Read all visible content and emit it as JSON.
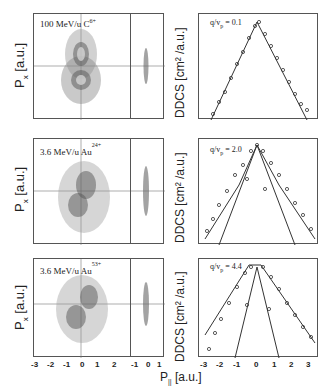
{
  "figure": {
    "x_axis_label": "P",
    "x_axis_sub": "||",
    "x_axis_unit": " [a.u.]",
    "rows": [
      {
        "label": "100 MeV/u C",
        "charge": "6+",
        "ylabel": "P",
        "ysub": "x",
        "yunit": " [a.u.]",
        "ddcs_label": "DDCS [cm² /a.u.]",
        "q_label": "q/v",
        "q_sub": "p",
        "q_value": " = 0.1"
      },
      {
        "label": "3.6 MeV/u  Au",
        "charge": "24+",
        "ylabel": "P",
        "ysub": "x",
        "yunit": " [a.u.]",
        "ddcs_label": "DDCS [cm² /a.u.]",
        "q_label": "q/v",
        "q_sub": "p",
        "q_value": " = 2.0"
      },
      {
        "label": "3.6 MeV/u  Au",
        "charge": "53+",
        "ylabel": "P",
        "ysub": "x",
        "yunit": " [a.u.]",
        "ddcs_label": "DDCS [cm² /a.u.]",
        "q_label": "q/v",
        "q_sub": "p",
        "q_value": " = 4.4"
      }
    ],
    "left_xticks": [
      "-3",
      "-2",
      "-1",
      "0",
      "1",
      "2"
    ],
    "proj_xticks": [
      "-1",
      "0",
      "1"
    ],
    "right_xticks": [
      "-3",
      "-2",
      "-1",
      "0",
      "1",
      "2",
      "3"
    ]
  }
}
